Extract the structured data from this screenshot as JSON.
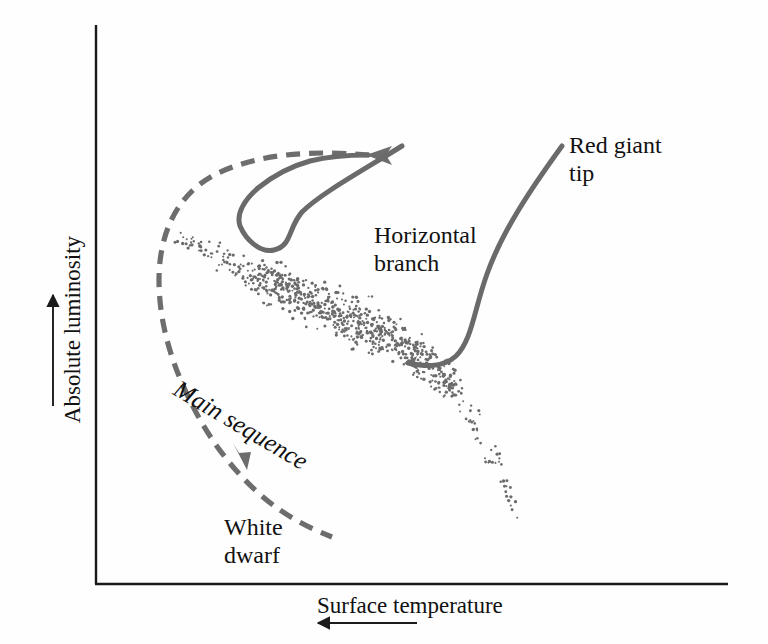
{
  "figure": {
    "kind": "hertzsprung-russell-diagram",
    "axes": {
      "x_label": "Surface temperature",
      "x_arrow_direction": "left",
      "y_label": "Absolute luminosity",
      "y_arrow_direction": "up",
      "axis_color": "#1a1a1a"
    },
    "annotations": {
      "red_giant_tip": "Red giant\ntip",
      "horizontal_branch": "Horizontal\nbranch",
      "white_dwarf": "White\ndwarf",
      "main_sequence": "Main sequence"
    },
    "colors": {
      "track": "#6d6d6d",
      "leader": "#6a6a6a",
      "stars": "#6b6b6b",
      "axis": "#1a1a1a",
      "background": "#fefefe"
    }
  },
  "chart_data": {
    "type": "scatter",
    "title": "",
    "xlabel": "Surface temperature",
    "ylabel": "Absolute luminosity",
    "xlabel_arrow": "left",
    "ylabel_arrow": "up",
    "axis_ticks": "none",
    "grid": false,
    "legend": "none",
    "axis_box": {
      "x0": 96,
      "y0": 584,
      "x1": 728,
      "y1": 25
    },
    "series": [
      {
        "name": "Main sequence",
        "type": "scatter",
        "point_count": 820,
        "marker_color": "#6b6b6b",
        "marker_size_px": 2.6,
        "band_start": [
          178,
          237
        ],
        "band_end": [
          521,
          520
        ],
        "description": "Dense diagonal band of stars running from upper-left (hot, luminous) to lower-right (cool, faint), widening toward the middle and curving down steeply at the right end."
      },
      {
        "name": "Evolutionary track",
        "type": "line",
        "style": "dashed",
        "color": "#6d6d6d",
        "dash_px": [
          14,
          9
        ],
        "width_px": 5,
        "arrowheads": [
          {
            "at": [
              370,
              155
            ],
            "direction": "left"
          },
          {
            "at": [
              245,
              466
            ],
            "direction": "down-right"
          }
        ],
        "path_points": [
          [
            370,
            155
          ],
          [
            300,
            152
          ],
          [
            232,
            163
          ],
          [
            182,
            194
          ],
          [
            160,
            241
          ],
          [
            160,
            296
          ],
          [
            181,
            352
          ],
          [
            216,
            418
          ],
          [
            255,
            477
          ],
          [
            296,
            516
          ],
          [
            330,
            536
          ]
        ],
        "description": "Dashed loop leaving the main sequence, rising to the red giant tip, back across the horizontal branch, then descending to the white dwarf region."
      },
      {
        "name": "Red giant tip leader (upper)",
        "type": "curve",
        "color": "#6a6a6a",
        "width_px": 5,
        "arrowhead": {
          "at": [
            370,
            155
          ],
          "direction": "left"
        },
        "path": "from label at (560,150) curving left and down through (470,160) and (455,205) to the horizontal-branch tip at (400,222), then back up to the arrow"
      },
      {
        "name": "Red giant tip leader (lower)",
        "type": "curve",
        "color": "#6a6a6a",
        "width_px": 5,
        "arrowhead": {
          "at": [
            404,
            362
          ],
          "direction": "down-left"
        },
        "path": "from label at (560,150) sweeping down through (500,235) and (475,300) to the upper main sequence at (404,362)"
      }
    ],
    "annotations": [
      {
        "text": "Red giant tip",
        "x": 569,
        "y": 131,
        "rotation": 0
      },
      {
        "text": "Horizontal branch",
        "x": 374,
        "y": 221,
        "rotation": 0
      },
      {
        "text": "Main sequence",
        "x": 176,
        "y": 372,
        "rotation": 30.5
      },
      {
        "text": "White dwarf",
        "x": 224,
        "y": 513,
        "rotation": 0
      }
    ]
  }
}
